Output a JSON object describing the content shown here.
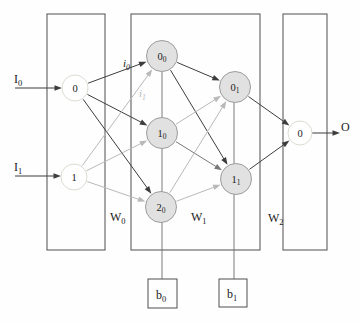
{
  "diagram": {
    "canvas": {
      "width": 361,
      "height": 323,
      "background": "#fefefe"
    },
    "palette": {
      "dark": "#3d3d3d",
      "medium": "#787878",
      "light": "#b9b9b9",
      "bias": "#6e6e6e",
      "box": "#4f4f4f",
      "hidden_fill": "#e1e1e1",
      "hidden_border": "#9d9d9d",
      "io_fill": "#ffffff",
      "io_border": "#dcdcd4",
      "text": "#1a1a1a"
    },
    "boxes": [
      {
        "name": "input-layer-box",
        "x": 47,
        "y": 14,
        "w": 58,
        "h": 236
      },
      {
        "name": "hidden-layers-box",
        "x": 131,
        "y": 14,
        "w": 129,
        "h": 236
      },
      {
        "name": "output-layer-box",
        "x": 283,
        "y": 14,
        "w": 44,
        "h": 236
      },
      {
        "name": "bias-box-b0",
        "x": 148,
        "y": 279,
        "w": 29,
        "h": 29
      },
      {
        "name": "bias-box-b1",
        "x": 219,
        "y": 279,
        "w": 28,
        "h": 28
      }
    ],
    "bias_lines": [
      {
        "name": "bias-line-hidden1-to-b0",
        "x1": 162,
        "y1": 56,
        "x2": 162,
        "y2": 279
      },
      {
        "name": "bias-line-hidden2-to-b1",
        "x1": 234,
        "y1": 87,
        "x2": 234,
        "y2": 279
      }
    ],
    "nodes": [
      {
        "id": "in0",
        "label": "0",
        "sub": "",
        "x": 75,
        "y": 88,
        "r": 13,
        "type": "io"
      },
      {
        "id": "in1",
        "label": "1",
        "sub": "",
        "x": 74,
        "y": 177,
        "r": 13,
        "type": "io"
      },
      {
        "id": "h00",
        "label": "0",
        "sub": "0",
        "x": 162,
        "y": 56,
        "r": 15.5,
        "type": "hidden"
      },
      {
        "id": "h10",
        "label": "1",
        "sub": "0",
        "x": 162,
        "y": 133,
        "r": 15.5,
        "type": "hidden"
      },
      {
        "id": "h20",
        "label": "2",
        "sub": "0",
        "x": 161,
        "y": 207,
        "r": 15.5,
        "type": "hidden"
      },
      {
        "id": "h01",
        "label": "0",
        "sub": "1",
        "x": 235,
        "y": 87,
        "r": 15.5,
        "type": "hidden"
      },
      {
        "id": "h11",
        "label": "1",
        "sub": "1",
        "x": 236,
        "y": 179,
        "r": 15.5,
        "type": "hidden"
      },
      {
        "id": "out0",
        "label": "0",
        "sub": "",
        "x": 300,
        "y": 133,
        "r": 12,
        "type": "io"
      }
    ],
    "edges": [
      {
        "from": "in0",
        "to": "h00",
        "tone": "dark"
      },
      {
        "from": "in0",
        "to": "h10",
        "tone": "dark"
      },
      {
        "from": "in0",
        "to": "h20",
        "tone": "dark"
      },
      {
        "from": "in1",
        "to": "h00",
        "tone": "light"
      },
      {
        "from": "in1",
        "to": "h10",
        "tone": "light"
      },
      {
        "from": "in1",
        "to": "h20",
        "tone": "light"
      },
      {
        "from": "h00",
        "to": "h01",
        "tone": "dark"
      },
      {
        "from": "h00",
        "to": "h11",
        "tone": "dark"
      },
      {
        "from": "h10",
        "to": "h01",
        "tone": "light"
      },
      {
        "from": "h10",
        "to": "h11",
        "tone": "medium"
      },
      {
        "from": "h20",
        "to": "h01",
        "tone": "light"
      },
      {
        "from": "h20",
        "to": "h11",
        "tone": "light"
      },
      {
        "from": "h01",
        "to": "out0",
        "tone": "dark"
      },
      {
        "from": "h11",
        "to": "out0",
        "tone": "dark"
      }
    ],
    "arrows": [
      {
        "name": "input-arrow-I0",
        "x1": 15,
        "y1": 88,
        "x2": 62,
        "y2": 88,
        "tone": "dark"
      },
      {
        "name": "input-arrow-I1",
        "x1": 15,
        "y1": 176,
        "x2": 61,
        "y2": 176,
        "tone": "dark"
      },
      {
        "name": "output-arrow-O",
        "x1": 312,
        "y1": 133,
        "x2": 340,
        "y2": 133,
        "tone": "dark"
      }
    ],
    "labels": [
      {
        "name": "label-input-I0",
        "text": "I",
        "sub": "0",
        "x": 14,
        "y": 83,
        "size": 12,
        "italic": false,
        "tone": "text"
      },
      {
        "name": "label-input-I1",
        "text": "I",
        "sub": "1",
        "x": 14,
        "y": 171,
        "size": 12,
        "italic": false,
        "tone": "text"
      },
      {
        "name": "label-output-O",
        "text": "O",
        "sub": "",
        "x": 341,
        "y": 131,
        "size": 12,
        "italic": false,
        "tone": "text"
      },
      {
        "name": "label-edge-i0",
        "text": "i",
        "sub": "0",
        "x": 123,
        "y": 67,
        "size": 11,
        "italic": true,
        "tone": "text"
      },
      {
        "name": "label-edge-i1",
        "text": "i",
        "sub": "1",
        "x": 139,
        "y": 97,
        "size": 11,
        "italic": true,
        "tone": "light"
      },
      {
        "name": "label-weights-W0",
        "text": "W",
        "sub": "0",
        "x": 110,
        "y": 221,
        "size": 12,
        "italic": false,
        "tone": "text"
      },
      {
        "name": "label-weights-W1",
        "text": "W",
        "sub": "1",
        "x": 191,
        "y": 221,
        "size": 12,
        "italic": false,
        "tone": "text"
      },
      {
        "name": "label-weights-W2",
        "text": "W",
        "sub": "2",
        "x": 268,
        "y": 222,
        "size": 12,
        "italic": false,
        "tone": "text"
      },
      {
        "name": "label-bias-b0",
        "text": "b",
        "sub": "0",
        "x": 156,
        "y": 299,
        "size": 12,
        "italic": false,
        "tone": "text"
      },
      {
        "name": "label-bias-b1",
        "text": "b",
        "sub": "1",
        "x": 227,
        "y": 298,
        "size": 12,
        "italic": false,
        "tone": "text"
      }
    ]
  }
}
